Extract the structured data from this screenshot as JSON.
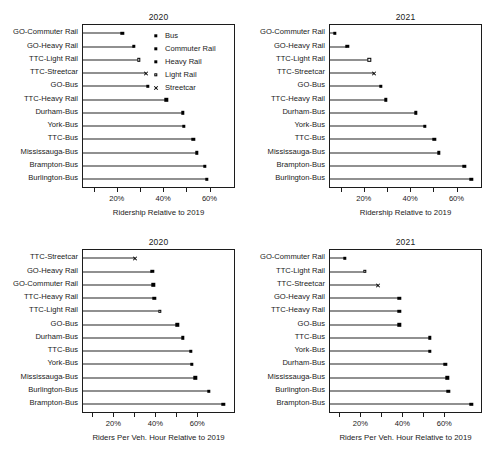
{
  "figure": {
    "panels": [
      {
        "id": "panel-tl",
        "title": "2020",
        "xlabel": "Ridership Relative to 2019",
        "has_legend": true
      },
      {
        "id": "panel-tr",
        "title": "2021",
        "xlabel": "Ridership Relative to 2019",
        "has_legend": false
      },
      {
        "id": "panel-bl",
        "title": "2020",
        "xlabel": "Riders Per Veh. Hour Relative to 2019",
        "has_legend": false
      },
      {
        "id": "panel-br",
        "title": "2021",
        "xlabel": "Riders Per Veh. Hour Relative to 2019",
        "has_legend": false
      }
    ],
    "legend": {
      "items": [
        {
          "label": "Bus",
          "marker": "filled-square"
        },
        {
          "label": "Commuter Rail",
          "marker": "filled-square"
        },
        {
          "label": "Heavy Rail",
          "marker": "filled-square"
        },
        {
          "label": "Light Rail",
          "marker": "open-square"
        },
        {
          "label": "Streetcar",
          "marker": "cross"
        }
      ]
    },
    "xticks": {
      "values": [
        10,
        20,
        30,
        40,
        50,
        60
      ],
      "labeled": [
        {
          "value": 20,
          "label": "20%"
        },
        {
          "value": 40,
          "label": "40%"
        },
        {
          "value": 60,
          "label": "60%"
        }
      ]
    }
  },
  "chart_data": [
    {
      "type": "line",
      "panel": "top-left",
      "title": "2020",
      "xlabel": "Ridership Relative to 2019",
      "ylabel": "",
      "xlim": [
        5,
        71
      ],
      "xunit": "percent",
      "grid": false,
      "legend_position": "top-right-inside",
      "categories": [
        "GO-Commuter Rail",
        "GO-Heavy Rail",
        "TTC-Light Rail",
        "TTC-Streetcar",
        "GO-Bus",
        "TTC-Heavy Rail",
        "Durham-Bus",
        "York-Bus",
        "TTC-Bus",
        "Mississauga-Bus",
        "Brampton-Bus",
        "Burlington-Bus"
      ],
      "values": [
        22,
        27,
        29,
        32,
        33,
        41,
        48,
        48.5,
        52.5,
        54,
        57.5,
        58.5
      ],
      "modes": [
        "Commuter Rail",
        "Heavy Rail",
        "Light Rail",
        "Streetcar",
        "Bus",
        "Heavy Rail",
        "Bus",
        "Bus",
        "Bus",
        "Bus",
        "Bus",
        "Bus"
      ]
    },
    {
      "type": "line",
      "panel": "top-right",
      "title": "2021",
      "xlabel": "Ridership Relative to 2019",
      "ylabel": "",
      "xlim": [
        5,
        71
      ],
      "xunit": "percent",
      "grid": false,
      "legend_position": "none",
      "categories": [
        "GO-Commuter Rail",
        "GO-Heavy Rail",
        "TTC-Light Rail",
        "TTC-Streetcar",
        "GO-Bus",
        "TTC-Heavy Rail",
        "Durham-Bus",
        "York-Bus",
        "TTC-Bus",
        "Mississauga-Bus",
        "Brampton-Bus",
        "Burlington-Bus"
      ],
      "values": [
        7,
        12.5,
        22,
        24,
        27,
        29,
        42,
        46,
        50,
        52,
        63,
        66
      ],
      "modes": [
        "Commuter Rail",
        "Heavy Rail",
        "Light Rail",
        "Streetcar",
        "Bus",
        "Heavy Rail",
        "Bus",
        "Bus",
        "Bus",
        "Bus",
        "Bus",
        "Bus"
      ]
    },
    {
      "type": "line",
      "panel": "bottom-left",
      "title": "2020",
      "xlabel": "Riders Per Veh. Hour Relative to 2019",
      "ylabel": "",
      "xlim": [
        5,
        78
      ],
      "xunit": "percent",
      "grid": false,
      "legend_position": "none",
      "categories": [
        "TTC-Streetcar",
        "GO-Heavy Rail",
        "GO-Commuter Rail",
        "TTC-Heavy Rail",
        "TTC-Light Rail",
        "GO-Bus",
        "Durham-Bus",
        "TTC-Bus",
        "York-Bus",
        "Mississauga-Bus",
        "Burlington-Bus",
        "Brampton-Bus"
      ],
      "values": [
        30,
        38,
        38.5,
        39,
        41.5,
        50,
        52.5,
        56.5,
        57,
        58.5,
        65,
        72
      ],
      "modes": [
        "Streetcar",
        "Heavy Rail",
        "Commuter Rail",
        "Heavy Rail",
        "Light Rail",
        "Bus",
        "Bus",
        "Bus",
        "Bus",
        "Bus",
        "Bus",
        "Bus"
      ]
    },
    {
      "type": "line",
      "panel": "bottom-right",
      "title": "2021",
      "xlabel": "Riders Per Veh. Hour Relative to 2019",
      "ylabel": "",
      "xlim": [
        5,
        78
      ],
      "xunit": "percent",
      "grid": false,
      "legend_position": "none",
      "categories": [
        "GO-Commuter Rail",
        "TTC-Light Rail",
        "TTC-Streetcar",
        "GO-Heavy Rail",
        "TTC-Heavy Rail",
        "GO-Bus",
        "TTC-Bus",
        "York-Bus",
        "Durham-Bus",
        "Mississauga-Bus",
        "Burlington-Bus",
        "Brampton-Bus"
      ],
      "values": [
        12,
        21.5,
        28,
        38,
        38,
        38,
        52.5,
        52.5,
        60,
        61,
        61.5,
        72.5
      ],
      "modes": [
        "Commuter Rail",
        "Light Rail",
        "Streetcar",
        "Heavy Rail",
        "Heavy Rail",
        "Bus",
        "Bus",
        "Bus",
        "Bus",
        "Bus",
        "Bus",
        "Bus"
      ]
    }
  ]
}
